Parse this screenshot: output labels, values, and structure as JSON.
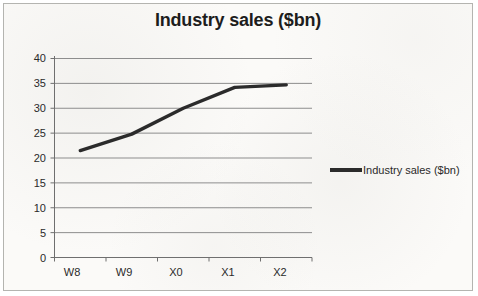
{
  "chart_data": {
    "type": "line",
    "title": "Industry sales ($bn)",
    "xlabel": "",
    "ylabel": "",
    "categories": [
      "W8",
      "W9",
      "X0",
      "X1",
      "X2"
    ],
    "series": [
      {
        "name": "Industry sales ($bn)",
        "values": [
          21.5,
          24.8,
          30.0,
          34.2,
          34.7
        ],
        "color": "#2b2b2b"
      }
    ],
    "ylim": [
      0,
      40
    ],
    "ytick_step": 5,
    "yticks": [
      40,
      35,
      30,
      25,
      20,
      15,
      10,
      5,
      0
    ],
    "grid": "horizontal",
    "legend_position": "right",
    "legend_entries": [
      "Industry sales ($bn)"
    ]
  },
  "colors": {
    "line": "#2b2b2b",
    "grid": "#8d8d8d",
    "axis": "#6f6f6f",
    "border": "#b4b4b0",
    "background": "#fbfaf8",
    "text": "#2a2a2a",
    "title_text": "#1d1d1d"
  }
}
